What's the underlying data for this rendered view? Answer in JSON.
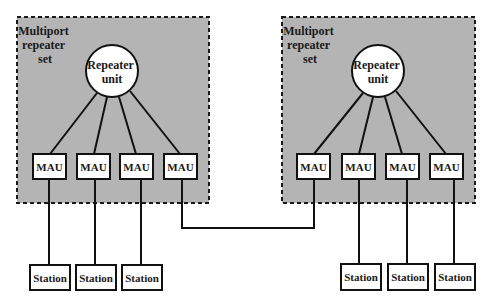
{
  "diagram": {
    "title": "",
    "repeater_sets": [
      {
        "label_lines": [
          "Multiport",
          "repeater",
          "set"
        ],
        "repeater_unit": {
          "label_lines": [
            "Repeater",
            "unit"
          ]
        },
        "maus": [
          "MAU",
          "MAU",
          "MAU",
          "MAU"
        ],
        "stations": [
          "Station",
          "Station",
          "Station"
        ]
      },
      {
        "label_lines": [
          "Multiport",
          "repeater",
          "set"
        ],
        "repeater_unit": {
          "label_lines": [
            "Repeater",
            "unit"
          ]
        },
        "maus": [
          "MAU",
          "MAU",
          "MAU",
          "MAU"
        ],
        "stations": [
          "Station",
          "Station",
          "Station"
        ]
      }
    ],
    "link": {
      "from": "left set MAU 4",
      "to": "right set MAU 1"
    },
    "colors": {
      "set_fill": "#b4b4b4",
      "stroke": "#111111",
      "node_fill": "#ffffff"
    }
  }
}
